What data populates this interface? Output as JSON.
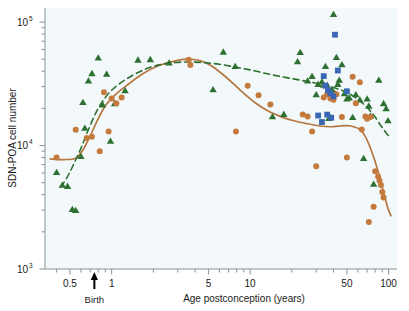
{
  "chart_data": {
    "type": "scatter",
    "title": "",
    "subtitle": "",
    "xlabel": "Age postconception (years)",
    "ylabel": "SDN-POA cell number",
    "xscale": "log",
    "yscale": "log",
    "xlim": [
      0.33,
      115
    ],
    "ylim": [
      1000,
      130000
    ],
    "grid": false,
    "legend": "none",
    "xticks": [
      {
        "value": 0.5,
        "label": "0.5"
      },
      {
        "value": 1,
        "label": "1"
      },
      {
        "value": 5,
        "label": "5"
      },
      {
        "value": 10,
        "label": "10"
      },
      {
        "value": 50,
        "label": "50"
      },
      {
        "value": 100,
        "label": "100"
      }
    ],
    "x_minor_ticks": [
      0.4,
      0.6,
      0.7,
      0.8,
      0.9,
      2,
      3,
      4,
      6,
      7,
      8,
      9,
      20,
      30,
      40,
      60,
      70,
      80,
      90
    ],
    "yticks": [
      {
        "value": 1000,
        "label": "10",
        "exponent": "3"
      },
      {
        "value": 10000,
        "label": "10",
        "exponent": "4"
      },
      {
        "value": 100000,
        "label": "10",
        "exponent": "5"
      }
    ],
    "y_minor_ticks": [
      2000,
      3000,
      4000,
      5000,
      6000,
      7000,
      8000,
      9000,
      20000,
      30000,
      40000,
      50000,
      60000,
      70000,
      80000,
      90000
    ],
    "annotations": [
      {
        "name": "birth-arrow",
        "label": "Birth",
        "x": 0.75,
        "type": "arrow-up"
      }
    ],
    "series": [
      {
        "name": "Green triangles",
        "marker": "triangle",
        "color": "#2e7031",
        "points": [
          [
            0.4,
            6100
          ],
          [
            0.44,
            4800
          ],
          [
            0.48,
            4700
          ],
          [
            0.52,
            3050
          ],
          [
            0.55,
            3000
          ],
          [
            0.6,
            8200
          ],
          [
            0.62,
            22500
          ],
          [
            0.64,
            13900
          ],
          [
            0.68,
            33500
          ],
          [
            0.72,
            38500
          ],
          [
            0.8,
            51500
          ],
          [
            0.86,
            21500
          ],
          [
            0.92,
            38000
          ],
          [
            0.98,
            10900
          ],
          [
            1.05,
            22000
          ],
          [
            1.25,
            28000
          ],
          [
            1.55,
            49500
          ],
          [
            1.9,
            50000
          ],
          [
            2.6,
            47000
          ],
          [
            5.4,
            28500
          ],
          [
            6.4,
            57500
          ],
          [
            7.8,
            44000
          ],
          [
            14.5,
            17200
          ],
          [
            17.5,
            18000
          ],
          [
            22.0,
            48000
          ],
          [
            23.0,
            57000
          ],
          [
            26.0,
            33500
          ],
          [
            28.0,
            36500
          ],
          [
            30.0,
            26000
          ],
          [
            31.0,
            31500
          ],
          [
            33.0,
            33000
          ],
          [
            34.0,
            31000
          ],
          [
            35.0,
            44000
          ],
          [
            36.0,
            31000
          ],
          [
            37.0,
            16700
          ],
          [
            38.0,
            17000
          ],
          [
            39.0,
            28500
          ],
          [
            40.0,
            116000
          ],
          [
            41.0,
            26500
          ],
          [
            42.0,
            52000
          ],
          [
            43.0,
            31500
          ],
          [
            44.0,
            34000
          ],
          [
            46.0,
            45500
          ],
          [
            48.0,
            26500
          ],
          [
            50.0,
            24000
          ],
          [
            52.0,
            24500
          ],
          [
            55.0,
            17000
          ],
          [
            58.0,
            26000
          ],
          [
            62.0,
            23500
          ],
          [
            66.0,
            7900
          ],
          [
            70.0,
            24000
          ],
          [
            72.0,
            21000
          ],
          [
            74.0,
            17500
          ],
          [
            78.0,
            4900
          ],
          [
            85.0,
            34000
          ],
          [
            92.0,
            22000
          ],
          [
            96.0,
            20000
          ],
          [
            99.0,
            16000
          ]
        ]
      },
      {
        "name": "Orange circles",
        "marker": "circle",
        "color": "#c4793d",
        "points": [
          [
            0.4,
            8000
          ],
          [
            0.55,
            13400
          ],
          [
            0.66,
            11500
          ],
          [
            0.72,
            11800
          ],
          [
            0.82,
            9000
          ],
          [
            0.88,
            27000
          ],
          [
            0.95,
            13000
          ],
          [
            1.0,
            24000
          ],
          [
            1.08,
            22000
          ],
          [
            1.18,
            24500
          ],
          [
            3.6,
            49500
          ],
          [
            3.7,
            45000
          ],
          [
            7.9,
            13000
          ],
          [
            9.6,
            30500
          ],
          [
            11.5,
            25500
          ],
          [
            14.0,
            21500
          ],
          [
            24.0,
            17800
          ],
          [
            26.0,
            17200
          ],
          [
            28.0,
            13000
          ],
          [
            30.0,
            6800
          ],
          [
            34.0,
            24500
          ],
          [
            36.0,
            26000
          ],
          [
            38.0,
            24000
          ],
          [
            40.0,
            23500
          ],
          [
            42.0,
            26000
          ],
          [
            46.0,
            17000
          ],
          [
            50.0,
            8000
          ],
          [
            55.0,
            36000
          ],
          [
            58.0,
            22000
          ],
          [
            62.0,
            32500
          ],
          [
            68.0,
            17200
          ],
          [
            70.0,
            16500
          ],
          [
            74.0,
            17000
          ],
          [
            80.0,
            6200
          ],
          [
            84.0,
            5600
          ],
          [
            86.0,
            5200
          ],
          [
            88.0,
            4800
          ],
          [
            90.0,
            4200
          ],
          [
            92.0,
            3800
          ],
          [
            78.0,
            3200
          ],
          [
            72.0,
            2400
          ],
          [
            64.0,
            13500
          ]
        ]
      },
      {
        "name": "Blue squares",
        "marker": "square",
        "color": "#3a67b5",
        "points": [
          [
            41.0,
            79000
          ],
          [
            34.0,
            36500
          ],
          [
            36.0,
            17800
          ],
          [
            38.0,
            26500
          ],
          [
            40.0,
            25000
          ],
          [
            43.0,
            40500
          ],
          [
            35.0,
            30500
          ],
          [
            31.0,
            17500
          ],
          [
            33.0,
            15500
          ],
          [
            38.5,
            16800
          ],
          [
            50.0,
            27500
          ],
          [
            36.5,
            28000
          ]
        ]
      }
    ],
    "fit_curves": [
      {
        "name": "Solid brown fit curve",
        "style": "solid",
        "color": "#b5763f",
        "points": [
          [
            0.36,
            7800
          ],
          [
            0.45,
            7700
          ],
          [
            0.55,
            7900
          ],
          [
            0.62,
            9200
          ],
          [
            0.7,
            12000
          ],
          [
            0.8,
            16500
          ],
          [
            0.9,
            21000
          ],
          [
            1.05,
            25500
          ],
          [
            1.3,
            31000
          ],
          [
            1.7,
            38500
          ],
          [
            2.2,
            44500
          ],
          [
            3.0,
            49000
          ],
          [
            3.7,
            50000
          ],
          [
            4.4,
            48500
          ],
          [
            5.2,
            44500
          ],
          [
            6.2,
            38500
          ],
          [
            7.5,
            32000
          ],
          [
            9.0,
            26500
          ],
          [
            11.0,
            22000
          ],
          [
            13.5,
            19000
          ],
          [
            17.0,
            17000
          ],
          [
            21.0,
            15800
          ],
          [
            26.0,
            15000
          ],
          [
            32.0,
            14400
          ],
          [
            38.0,
            14200
          ],
          [
            44.0,
            14400
          ],
          [
            50.0,
            14500
          ],
          [
            56.0,
            14200
          ],
          [
            62.0,
            13500
          ],
          [
            68.0,
            11800
          ],
          [
            74.0,
            9500
          ],
          [
            80.0,
            7400
          ],
          [
            86.0,
            5600
          ],
          [
            92.0,
            4200
          ],
          [
            98.0,
            3200
          ],
          [
            104.0,
            2700
          ]
        ]
      },
      {
        "name": "Dashed green fit curve",
        "style": "dashed",
        "color": "#2e7031",
        "points": [
          [
            0.43,
            4600
          ],
          [
            0.48,
            5600
          ],
          [
            0.53,
            7000
          ],
          [
            0.6,
            9500
          ],
          [
            0.68,
            13500
          ],
          [
            0.78,
            19000
          ],
          [
            0.9,
            24500
          ],
          [
            1.05,
            29500
          ],
          [
            1.3,
            35000
          ],
          [
            1.7,
            41000
          ],
          [
            2.2,
            45000
          ],
          [
            2.9,
            47000
          ],
          [
            3.6,
            47500
          ],
          [
            4.6,
            47000
          ],
          [
            6.0,
            45500
          ],
          [
            8.0,
            43000
          ],
          [
            10.5,
            40500
          ],
          [
            13.5,
            38000
          ],
          [
            17.0,
            36000
          ],
          [
            21.0,
            34500
          ],
          [
            26.0,
            33000
          ],
          [
            32.0,
            31500
          ],
          [
            38.0,
            30000
          ],
          [
            44.0,
            28500
          ],
          [
            50.0,
            27000
          ],
          [
            56.0,
            25000
          ],
          [
            62.0,
            23000
          ],
          [
            68.0,
            21000
          ],
          [
            74.0,
            19000
          ],
          [
            80.0,
            17000
          ],
          [
            86.0,
            15000
          ],
          [
            92.0,
            13500
          ],
          [
            98.0,
            12300
          ],
          [
            104.0,
            11500
          ]
        ]
      }
    ]
  },
  "colors": {
    "plot_background": "#f3f9fa",
    "page_background": "#ffffff",
    "axis": "#8a9296",
    "text": "#1a1a1a",
    "green": "#2e7031",
    "orange": "#c4793d",
    "blue": "#3a67b5",
    "curve_brown": "#b5763f"
  }
}
